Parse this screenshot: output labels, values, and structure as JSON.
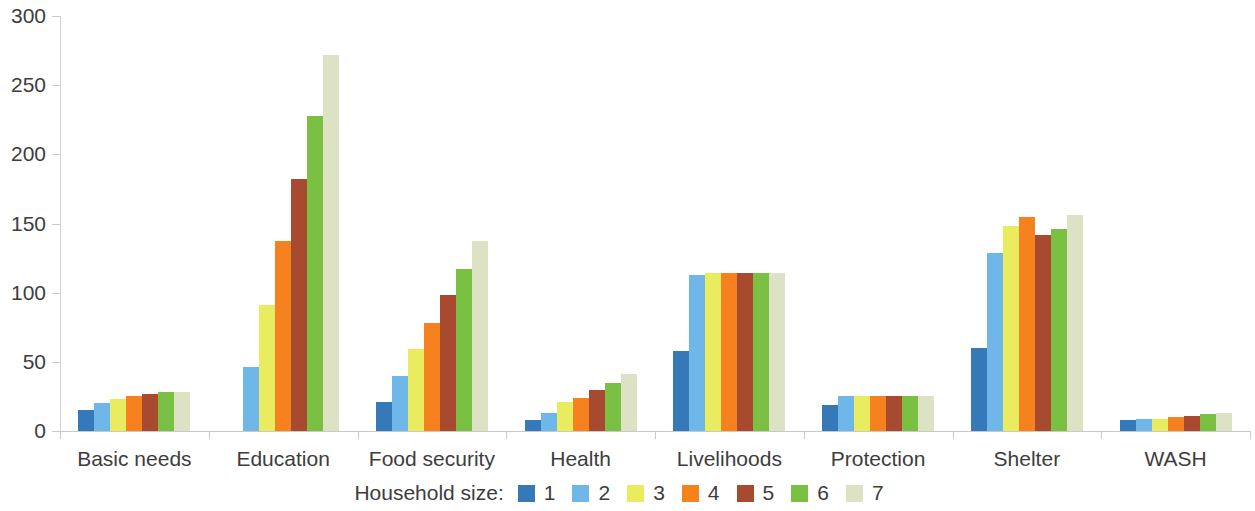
{
  "chart_data": {
    "type": "bar",
    "title": "",
    "subtitle": "",
    "xlabel": "",
    "ylabel": "",
    "ylim": [
      0,
      300
    ],
    "y_ticks": [
      0,
      50,
      100,
      150,
      200,
      250,
      300
    ],
    "grid": false,
    "legend_position": "bottom",
    "legend_title": "Household size:",
    "categories": [
      "Basic needs",
      "Education",
      "Food security",
      "Health",
      "Livelihoods",
      "Protection",
      "Shelter",
      "WASH"
    ],
    "series": [
      {
        "name": "1",
        "color": "#3579b8",
        "values": [
          15,
          0,
          21,
          8,
          58,
          19,
          60,
          8
        ]
      },
      {
        "name": "2",
        "color": "#6fb7e8",
        "values": [
          20,
          46,
          40,
          13,
          113,
          25,
          129,
          9
        ]
      },
      {
        "name": "3",
        "color": "#e9ec5e",
        "values": [
          23,
          91,
          59,
          21,
          114,
          25,
          148,
          9
        ]
      },
      {
        "name": "4",
        "color": "#f5821f",
        "values": [
          25,
          137,
          78,
          24,
          114,
          25,
          155,
          10
        ]
      },
      {
        "name": "5",
        "color": "#a84a2f",
        "values": [
          27,
          182,
          98,
          30,
          114,
          25,
          142,
          11
        ]
      },
      {
        "name": "6",
        "color": "#7ac143",
        "values": [
          28,
          228,
          117,
          35,
          114,
          25,
          146,
          12
        ]
      },
      {
        "name": "7",
        "color": "#dde2c4",
        "values": [
          28,
          272,
          137,
          41,
          114,
          25,
          156,
          13
        ]
      }
    ]
  }
}
